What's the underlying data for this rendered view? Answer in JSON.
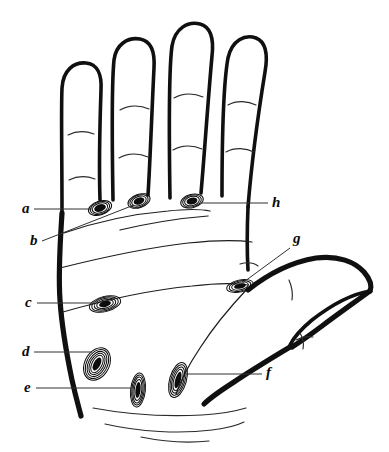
{
  "figure": {
    "name": "hand-palm-callus-diagram",
    "background_color": "#ffffff",
    "ink_color": "#101010",
    "width": 389,
    "height": 452,
    "style": "hand-drawn ink line art"
  },
  "labels": [
    {
      "id": "a",
      "text": "a",
      "x": 22,
      "y": 213,
      "side": "left",
      "target": "first-finger-base-callus"
    },
    {
      "id": "b",
      "text": "b",
      "x": 30,
      "y": 245,
      "side": "left",
      "target": "middle-finger-base-callus"
    },
    {
      "id": "c",
      "text": "c",
      "x": 25,
      "y": 307,
      "side": "left",
      "target": "mid-palm-callus"
    },
    {
      "id": "d",
      "text": "d",
      "x": 22,
      "y": 356,
      "side": "left",
      "target": "hypothenar-callus"
    },
    {
      "id": "e",
      "text": "e",
      "x": 24,
      "y": 392,
      "side": "left",
      "target": "lower-palm-callus"
    },
    {
      "id": "f",
      "text": "f",
      "x": 266,
      "y": 377,
      "side": "right",
      "target": "thenar-callus"
    },
    {
      "id": "g",
      "text": "g",
      "x": 293,
      "y": 243,
      "side": "right",
      "target": "index-base-callus"
    },
    {
      "id": "h",
      "text": "h",
      "x": 272,
      "y": 207,
      "side": "right",
      "target": "index-finger-axis"
    }
  ],
  "anatomy": {
    "fingers": [
      {
        "name": "little-finger",
        "creases": 2
      },
      {
        "name": "ring-finger",
        "creases": 2
      },
      {
        "name": "middle-finger",
        "creases": 2
      },
      {
        "name": "index-finger",
        "creases": 2
      }
    ],
    "thumb": {
      "name": "thumb",
      "has_nail_outline": true
    },
    "wrist": {
      "name": "wrist",
      "crease_lines": 3
    },
    "callus_count": 7
  },
  "callus_sites": [
    {
      "id": "a",
      "cx": 100,
      "cy": 208,
      "rx": 10,
      "ry": 6,
      "rotate": -18,
      "rings": 4
    },
    {
      "id": "b",
      "cx": 139,
      "cy": 201,
      "rx": 9,
      "ry": 6,
      "rotate": -20,
      "rings": 4
    },
    {
      "id": "h",
      "cx": 192,
      "cy": 201,
      "rx": 9,
      "ry": 6,
      "rotate": -14,
      "rings": 4
    },
    {
      "id": "g",
      "cx": 240,
      "cy": 286,
      "rx": 12,
      "ry": 6,
      "rotate": -12,
      "rings": 4
    },
    {
      "id": "c",
      "cx": 105,
      "cy": 304,
      "rx": 14,
      "ry": 7,
      "rotate": -14,
      "rings": 5
    },
    {
      "id": "d",
      "cx": 97,
      "cy": 364,
      "rx": 13,
      "ry": 16,
      "rotate": 28,
      "rings": 6
    },
    {
      "id": "e",
      "cx": 138,
      "cy": 390,
      "rx": 7,
      "ry": 17,
      "rotate": 6,
      "rings": 5
    },
    {
      "id": "f",
      "cx": 178,
      "cy": 380,
      "rx": 8,
      "ry": 18,
      "rotate": 16,
      "rings": 5
    }
  ]
}
